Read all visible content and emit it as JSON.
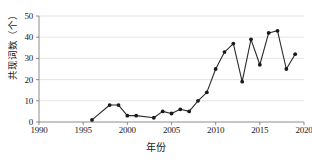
{
  "chart_data": {
    "type": "line",
    "title": "",
    "subtitle": "",
    "xlabel": "年份",
    "ylabel": "共现词数（个）",
    "xlim": [
      1990,
      2020
    ],
    "ylim": [
      0,
      50
    ],
    "xticks": [
      1990,
      1995,
      2000,
      2005,
      2010,
      2015,
      2020
    ],
    "yticks": [
      0,
      10,
      20,
      30,
      40,
      50
    ],
    "grid": true,
    "grid_axis": "y",
    "legend": null,
    "legend_position": "none",
    "marker": "filled-circle",
    "line_color": "#2b2b2b",
    "marker_color": "#1a1a1a",
    "grid_color": "#d9d9d9",
    "axis_color": "#808080",
    "background": "#ffffff",
    "x": [
      1996,
      1997,
      1998,
      1999,
      2000,
      2001,
      2002,
      2003,
      2004,
      2005,
      2006,
      2007,
      2008,
      2009,
      2010,
      2011,
      2012,
      2013,
      2014,
      2015,
      2016,
      2017,
      2018,
      2019
    ],
    "values": [
      1,
      3,
      8,
      8,
      3,
      3,
      2,
      5,
      4,
      6,
      5,
      10,
      14,
      25,
      33,
      37,
      19,
      39,
      27,
      42,
      43,
      25,
      32,
      32
    ],
    "series": [
      {
        "name": "共现词数",
        "x": [
          1996,
          1998,
          1999,
          2000,
          2001,
          2003,
          2004,
          2005,
          2006,
          2007,
          2008,
          2009,
          2010,
          2011,
          2012,
          2013,
          2014,
          2015,
          2016,
          2017,
          2018,
          2019
        ],
        "values": [
          1,
          8,
          8,
          3,
          3,
          2,
          5,
          4,
          6,
          5,
          10,
          14,
          25,
          33,
          37,
          19,
          39,
          27,
          42,
          43,
          25,
          32
        ]
      }
    ]
  },
  "axis": {
    "y_tick_labels": [
      "0",
      "10",
      "20",
      "30",
      "40",
      "50"
    ],
    "x_tick_labels": [
      "1990",
      "1995",
      "2000",
      "2005",
      "2010",
      "2015",
      "2020"
    ],
    "y_axis_title": "共现词数（个）",
    "x_axis_title": "年份"
  }
}
